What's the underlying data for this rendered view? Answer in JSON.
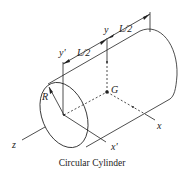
{
  "figure": {
    "caption": "Circular Cylinder",
    "labels": {
      "z_axis": "z",
      "x_axis": "x",
      "x_prime_axis": "x'",
      "y_axis": "y",
      "y_prime_axis": "y'",
      "radius": "R",
      "centroid": "G",
      "half_length_1": "L/2",
      "half_length_2": "L/2"
    },
    "colors": {
      "stroke": "#222222",
      "background": "#ffffff"
    }
  }
}
